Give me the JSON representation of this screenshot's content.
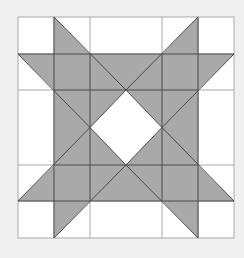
{
  "diagram": {
    "type": "quilt-star-pattern",
    "colors": {
      "background": "#f0f0f0",
      "cell": "#ffffff",
      "fill": "#a9a9a9",
      "grid_line": "#a8a8a8",
      "star_line": "#4a4a4a"
    },
    "grid": {
      "x": [
        18,
        54,
        90,
        162,
        198,
        234
      ],
      "y": [
        17,
        54,
        90,
        165,
        201,
        238
      ]
    },
    "center": [
      126,
      127.5
    ],
    "center_diamond": {
      "points": [
        [
          126,
          90
        ],
        [
          162,
          127.5
        ],
        [
          126,
          165
        ],
        [
          90,
          127.5
        ]
      ],
      "color": "#ffffff"
    },
    "star_points": [
      [
        [
          54,
          17
        ],
        [
          90,
          54
        ],
        [
          54,
          54
        ]
      ],
      [
        [
          198,
          17
        ],
        [
          198,
          54
        ],
        [
          162,
          54
        ]
      ],
      [
        [
          18,
          54
        ],
        [
          54,
          54
        ],
        [
          54,
          90
        ]
      ],
      [
        [
          234,
          54
        ],
        [
          198,
          54
        ],
        [
          198,
          90
        ]
      ],
      [
        [
          18,
          201
        ],
        [
          54,
          165
        ],
        [
          54,
          201
        ]
      ],
      [
        [
          234,
          201
        ],
        [
          198,
          165
        ],
        [
          198,
          201
        ]
      ],
      [
        [
          54,
          238
        ],
        [
          54,
          201
        ],
        [
          90,
          201
        ]
      ],
      [
        [
          198,
          238
        ],
        [
          198,
          201
        ],
        [
          162,
          201
        ]
      ]
    ]
  }
}
